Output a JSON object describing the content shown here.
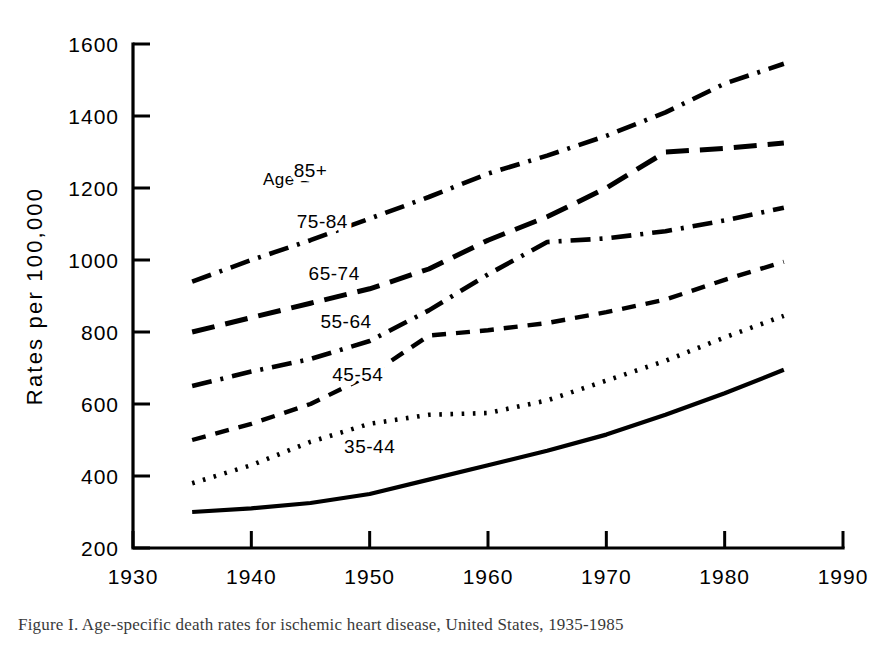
{
  "figure": {
    "title": "",
    "caption": "Figure  I.  Age-specific  death  rates  for  ischemic  heart  disease,  United  States,  1935-1985"
  },
  "axes": {
    "y_label": "Rates per 100,000",
    "x_label": "Year of Death",
    "y_ticks": [
      "200",
      "400",
      "600",
      "800",
      "1000",
      "1200",
      "1400",
      "1600"
    ],
    "x_ticks": [
      "1930",
      "1940",
      "1950",
      "1960",
      "1970",
      "1980",
      "1990"
    ]
  },
  "legend": {
    "heading": "Age =",
    "entries": [
      "85+",
      "75-84",
      "65-74",
      "55-64",
      "45-54",
      "35-44"
    ]
  },
  "chart_data": {
    "type": "line",
    "title": "",
    "xlabel": "Year of Death",
    "ylabel": "Rates per 100,000",
    "xlim": [
      1930,
      1990
    ],
    "ylim": [
      200,
      1600
    ],
    "xticks": [
      1930,
      1940,
      1950,
      1960,
      1970,
      1980,
      1990
    ],
    "yticks": [
      200,
      400,
      600,
      800,
      1000,
      1200,
      1400,
      1600
    ],
    "grid": false,
    "legend_position": "inline-labels",
    "x": [
      1935,
      1940,
      1945,
      1950,
      1955,
      1960,
      1965,
      1970,
      1975,
      1980,
      1985
    ],
    "series": [
      {
        "name": "85+",
        "linestyle": "dashdot",
        "label_x": 1945,
        "label_y": 1230,
        "values": [
          940,
          1000,
          1055,
          1115,
          1175,
          1240,
          1290,
          1345,
          1410,
          1490,
          1545
        ]
      },
      {
        "name": "75-84",
        "linestyle": "longdash",
        "label_x": 1946,
        "label_y": 1090,
        "values": [
          800,
          840,
          880,
          920,
          975,
          1055,
          1120,
          1200,
          1300,
          1310,
          1325
        ]
      },
      {
        "name": "65-74",
        "linestyle": "dashdot",
        "label_x": 1947,
        "label_y": 945,
        "values": [
          650,
          690,
          725,
          775,
          860,
          960,
          1050,
          1060,
          1080,
          1110,
          1145
        ]
      },
      {
        "name": "55-64",
        "linestyle": "shortdash",
        "label_x": 1948,
        "label_y": 810,
        "values": [
          500,
          545,
          600,
          680,
          790,
          805,
          825,
          855,
          890,
          945,
          995
        ]
      },
      {
        "name": "45-54",
        "linestyle": "dotted",
        "label_x": 1949,
        "label_y": 665,
        "values": [
          380,
          430,
          495,
          545,
          570,
          575,
          610,
          665,
          720,
          785,
          845
        ]
      },
      {
        "name": "35-44",
        "linestyle": "solid",
        "label_x": 1950,
        "label_y": 465,
        "values": [
          300,
          310,
          325,
          350,
          390,
          430,
          470,
          515,
          570,
          630,
          695
        ]
      }
    ]
  },
  "colors": {
    "ink": "#000000",
    "background": "#ffffff"
  }
}
